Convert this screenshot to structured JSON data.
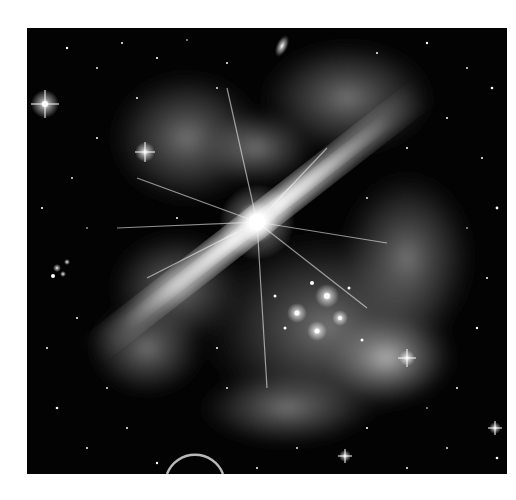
{
  "image": {
    "description": "Grayscale space illustration: a bright central star emitting two opposing jets, surrounded by glowing nebula clouds, a dense star cluster, a distant elliptical galaxy and the curved limb of a planet at bottom",
    "palette": {
      "background": "#ffffff",
      "space": "#030303",
      "nebula": "#8a8a8a",
      "glow": "#ffffff"
    },
    "features": {
      "central_star": {
        "x": 230,
        "y": 194
      },
      "jet_angle_deg": -38,
      "galaxy": {
        "x": 255,
        "y": 18
      },
      "bright_star_left": {
        "x": 18,
        "y": 76
      },
      "planet_arc": {
        "cx": 168,
        "cy": 462,
        "r": 28
      },
      "cluster": {
        "x": 300,
        "y": 290
      }
    }
  }
}
